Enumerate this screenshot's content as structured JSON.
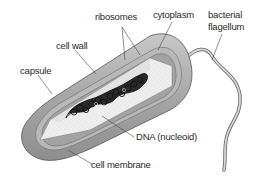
{
  "diagram": {
    "colors": {
      "capsule": "#9a9a9a",
      "capsule_light": "#c4c4c4",
      "cell_wall": "#b0b0b0",
      "cell_membrane": "#8e8e8e",
      "cytoplasm": "#ececec",
      "dna": "#111111",
      "label_text": "#2a2a2a",
      "leader_line": "#444444"
    },
    "labels": {
      "ribosomes": "ribosomes",
      "cytoplasm": "cytoplasm",
      "bacterial": "bacterial",
      "flagellum": "flagellum",
      "cell_wall": "cell wall",
      "capsule": "capsule",
      "dna": "DNA (nucleoid)",
      "cell_membrane": "cell membrane"
    }
  }
}
